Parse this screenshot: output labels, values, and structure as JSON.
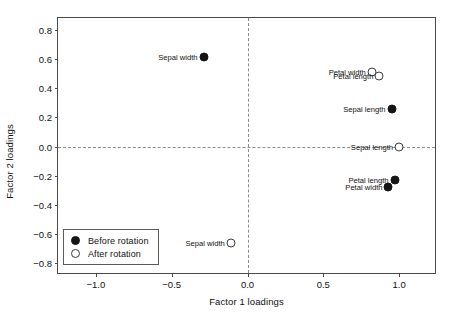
{
  "chart_data": {
    "type": "scatter",
    "title": "",
    "xlabel": "Factor 1 loadings",
    "ylabel": "Factor 2 loadings",
    "xlim": [
      -1.25,
      1.25
    ],
    "ylim": [
      -0.88,
      0.88
    ],
    "xticks": [
      "-1.0",
      "-0.5",
      "0.0",
      "0.5",
      "1.0"
    ],
    "xtick_values": [
      -1.0,
      -0.5,
      0.0,
      0.5,
      1.0
    ],
    "yticks": [
      "0.8",
      "0.6",
      "0.4",
      "0.2",
      "0.0",
      "-0.2",
      "-0.4",
      "-0.6",
      "-0.8"
    ],
    "ytick_values": [
      0.8,
      0.6,
      0.4,
      0.2,
      0.0,
      -0.2,
      -0.4,
      -0.6,
      -0.8
    ],
    "grid": false,
    "reference_lines": [
      {
        "orientation": "horizontal",
        "value": 0.0,
        "style": "dashed"
      },
      {
        "orientation": "vertical",
        "value": 0.0,
        "style": "dashed"
      }
    ],
    "legend": {
      "position": "bottom-left",
      "entries": [
        {
          "label": "Before rotation",
          "marker": "filled-circle"
        },
        {
          "label": "After rotation",
          "marker": "open-circle"
        }
      ]
    },
    "series": [
      {
        "name": "Before rotation",
        "marker": "filled-circle",
        "points": [
          {
            "label": "Sepal width",
            "x": -0.29,
            "y": 0.61,
            "label_side": "left"
          },
          {
            "label": "Sepal length",
            "x": 0.95,
            "y": 0.26,
            "label_side": "left"
          },
          {
            "label": "Petal length",
            "x": 0.97,
            "y": -0.23,
            "label_side": "left"
          },
          {
            "label": "Petal width",
            "x": 0.93,
            "y": -0.28,
            "label_side": "left"
          }
        ]
      },
      {
        "name": "After rotation",
        "marker": "open-circle",
        "points": [
          {
            "label": "Petal width",
            "x": 0.82,
            "y": 0.51,
            "label_side": "left"
          },
          {
            "label": "Petal length",
            "x": 0.87,
            "y": 0.48,
            "label_side": "left"
          },
          {
            "label": "Sepal length",
            "x": 1.0,
            "y": 0.0,
            "label_side": "left"
          },
          {
            "label": "Sepal width",
            "x": -0.11,
            "y": -0.66,
            "label_side": "left"
          }
        ]
      }
    ]
  }
}
